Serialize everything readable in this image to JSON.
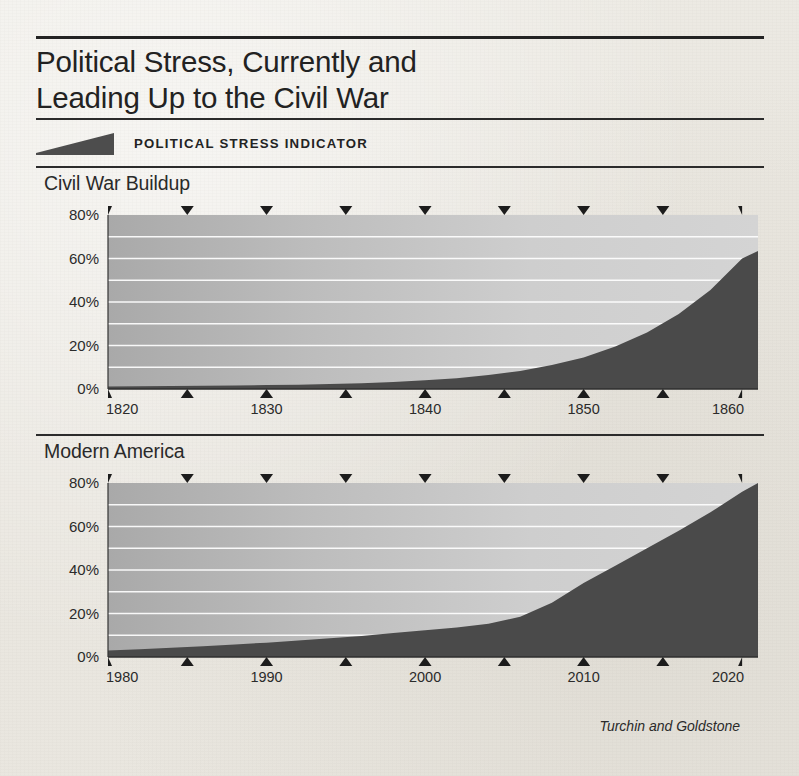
{
  "title": {
    "line1": "Political Stress, Currently and",
    "line2": "Leading Up to the Civil War"
  },
  "legend": {
    "label": "POLITICAL STRESS INDICATOR",
    "swatch_icon": "wedge-swatch",
    "swatch_color": "#4d4d4d"
  },
  "credit": "Turchin and Goldstone",
  "colors": {
    "series": "#4a4a4a",
    "plot_bg_left": "#a9a9a9",
    "plot_bg_right": "#d4d4d4",
    "gridline": "#ffffff",
    "rule": "#232323",
    "text": "#222222",
    "page_bg": "#eae7e0"
  },
  "chart_data": [
    {
      "type": "area",
      "title": "Civil War Buildup",
      "xlabel": "",
      "ylabel": "",
      "xlim": [
        1820,
        1861
      ],
      "ylim": [
        0,
        80
      ],
      "grid": true,
      "gridline_step": 10,
      "legend_position": "top",
      "x_ticks_labeled": [
        1820,
        1830,
        1840,
        1850,
        1860
      ],
      "x_tick_labels": [
        "1820",
        "1830",
        "1840",
        "1850",
        "1860"
      ],
      "x_ticks_minor_bottom": [
        1825,
        1835,
        1845,
        1855
      ],
      "x_ticks_top": [
        1820,
        1825,
        1830,
        1835,
        1840,
        1845,
        1850,
        1855,
        1860
      ],
      "y_ticks": [
        0,
        20,
        40,
        60,
        80
      ],
      "y_tick_labels": [
        "0%",
        "20%",
        "40%",
        "60%",
        "80%"
      ],
      "series": [
        {
          "name": "Political Stress Indicator",
          "x": [
            1820,
            1822,
            1824,
            1826,
            1828,
            1830,
            1832,
            1834,
            1836,
            1838,
            1840,
            1842,
            1844,
            1846,
            1848,
            1850,
            1852,
            1854,
            1856,
            1858,
            1860,
            1861
          ],
          "values": [
            1.2,
            1.3,
            1.4,
            1.5,
            1.6,
            1.8,
            2.0,
            2.3,
            2.7,
            3.2,
            4.0,
            5.0,
            6.4,
            8.3,
            11.0,
            14.5,
            19.5,
            26.0,
            34.5,
            45.5,
            60.0,
            63.5
          ]
        }
      ]
    },
    {
      "type": "area",
      "title": "Modern America",
      "xlabel": "",
      "ylabel": "",
      "xlim": [
        1980,
        2021
      ],
      "ylim": [
        0,
        80
      ],
      "grid": true,
      "gridline_step": 10,
      "legend_position": "top",
      "x_ticks_labeled": [
        1980,
        1990,
        2000,
        2010,
        2020
      ],
      "x_tick_labels": [
        "1980",
        "1990",
        "2000",
        "2010",
        "2020"
      ],
      "x_ticks_minor_bottom": [
        1985,
        1995,
        2005,
        2015
      ],
      "x_ticks_top": [
        1980,
        1985,
        1990,
        1995,
        2000,
        2005,
        2010,
        2015,
        2020
      ],
      "y_ticks": [
        0,
        20,
        40,
        60,
        80
      ],
      "y_tick_labels": [
        "0%",
        "20%",
        "40%",
        "60%",
        "80%"
      ],
      "series": [
        {
          "name": "Political Stress Indicator",
          "x": [
            1980,
            1982,
            1984,
            1986,
            1988,
            1990,
            1992,
            1994,
            1996,
            1998,
            2000,
            2002,
            2004,
            2006,
            2008,
            2010,
            2012,
            2014,
            2016,
            2018,
            2020,
            2021
          ],
          "values": [
            3.0,
            3.6,
            4.3,
            5.0,
            5.8,
            6.6,
            7.6,
            8.6,
            9.7,
            11.0,
            12.3,
            13.6,
            15.3,
            18.5,
            25.0,
            34.0,
            42.0,
            50.0,
            58.0,
            66.5,
            76.0,
            80.0
          ]
        }
      ]
    }
  ]
}
